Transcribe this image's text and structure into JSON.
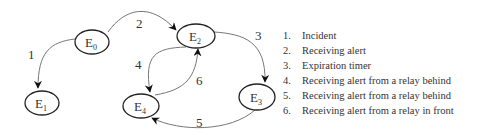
{
  "diagram": {
    "type": "state-transition",
    "nodes": [
      {
        "id": "E0",
        "base": "E",
        "sub": "0",
        "cx": 92,
        "cy": 42
      },
      {
        "id": "E1",
        "base": "E",
        "sub": "1",
        "cx": 42,
        "cy": 103
      },
      {
        "id": "E2",
        "base": "E",
        "sub": "2",
        "cx": 196,
        "cy": 36
      },
      {
        "id": "E3",
        "base": "E",
        "sub": "3",
        "cx": 257,
        "cy": 97
      },
      {
        "id": "E4",
        "base": "E",
        "sub": "4",
        "cx": 141,
        "cy": 106
      }
    ],
    "edges": [
      {
        "label": "1",
        "from": "E0",
        "to": "E1"
      },
      {
        "label": "2",
        "from": "E0",
        "to": "E2"
      },
      {
        "label": "3",
        "from": "E2",
        "to": "E3"
      },
      {
        "label": "4",
        "from": "E2",
        "to": "E4"
      },
      {
        "label": "5",
        "from": "E3",
        "to": "E4"
      },
      {
        "label": "6",
        "from": "E4",
        "to": "E2"
      }
    ]
  },
  "legend": [
    {
      "num": "1.",
      "text": "Incident"
    },
    {
      "num": "2.",
      "text": "Receiving alert"
    },
    {
      "num": "3.",
      "text": "Expiration timer"
    },
    {
      "num": "4.",
      "text": "Receiving alert from a relay behind"
    },
    {
      "num": "5.",
      "text": "Receiving alert from a relay behind"
    },
    {
      "num": "6.",
      "text": "Receiving alert from a relay in front"
    }
  ],
  "colors": {
    "node_stroke": "#222222",
    "edge_stroke": "#777777",
    "text": "#333333",
    "background": "#ffffff"
  }
}
